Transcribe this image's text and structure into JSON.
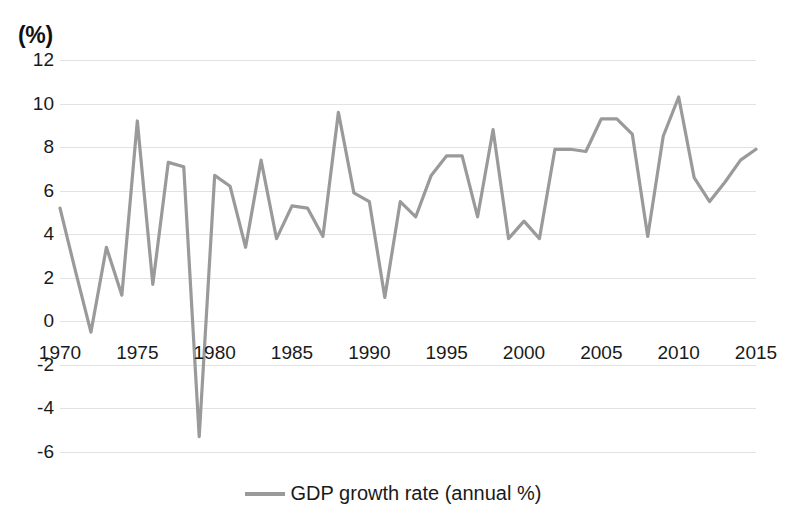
{
  "chart_data": {
    "type": "line",
    "title": "",
    "subtitle": "",
    "xlabel": "",
    "ylabel": "(%)",
    "unit_label": "(%)",
    "ylim": [
      -6,
      12
    ],
    "xlim": [
      1970,
      2015
    ],
    "grid": true,
    "legend_position": "bottom-center",
    "y_ticks": [
      12,
      10,
      8,
      6,
      4,
      2,
      0,
      -2,
      -4,
      -6
    ],
    "x_ticks": [
      1970,
      1975,
      1980,
      1985,
      1990,
      1995,
      2000,
      2005,
      2010,
      2015
    ],
    "series": [
      {
        "name": "GDP growth rate (annual %)",
        "color": "#9a9a9a",
        "x": [
          1970,
          1971,
          1972,
          1973,
          1974,
          1975,
          1976,
          1977,
          1978,
          1979,
          1980,
          1981,
          1982,
          1983,
          1984,
          1985,
          1986,
          1987,
          1988,
          1989,
          1990,
          1991,
          1992,
          1993,
          1994,
          1995,
          1996,
          1997,
          1998,
          1999,
          2000,
          2001,
          2002,
          2003,
          2004,
          2005,
          2006,
          2007,
          2008,
          2009,
          2010,
          2011,
          2012,
          2013,
          2014,
          2015
        ],
        "values": [
          5.2,
          2.3,
          -0.5,
          3.4,
          1.2,
          9.2,
          1.7,
          7.3,
          7.1,
          -5.3,
          6.7,
          6.2,
          3.4,
          7.4,
          3.8,
          5.3,
          5.2,
          3.9,
          9.6,
          5.9,
          5.5,
          1.1,
          5.5,
          4.8,
          6.7,
          7.6,
          7.6,
          4.8,
          8.8,
          3.8,
          4.6,
          3.8,
          7.9,
          7.9,
          7.8,
          9.3,
          9.3,
          8.6,
          3.9,
          8.5,
          10.3,
          6.6,
          5.5,
          6.4,
          7.4,
          7.9
        ]
      }
    ]
  },
  "legend": {
    "label": "GDP growth rate (annual %)"
  }
}
